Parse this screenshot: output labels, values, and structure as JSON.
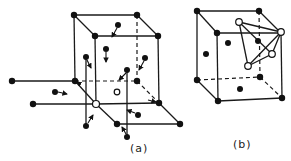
{
  "figure": {
    "panels": [
      {
        "id": "a",
        "label": "(a)",
        "description": "Vacancy in cubic lattice with neighboring atoms shown with displacement arrows toward vacancy"
      },
      {
        "id": "b",
        "label": "(b)",
        "description": "Cubic cell with tetrahedral arrangement of open sites"
      }
    ]
  },
  "labels": {
    "a": "(a)",
    "b": "(b)"
  },
  "colors": {
    "line": "#1a1a1a",
    "atom": "#111111",
    "vacancy_fill": "#ffffff",
    "background": "#ffffff"
  },
  "panel_a": {
    "cube": {
      "top_back_left": [
        74,
        15
      ],
      "top_back_right": [
        137,
        15
      ],
      "top_front_left": [
        95,
        36
      ],
      "top_front_right": [
        158,
        36
      ],
      "bottom_back_left": [
        75,
        81
      ],
      "bottom_back_right": [
        137,
        81
      ],
      "bottom_front_left": [
        96,
        104
      ],
      "bottom_front_right": [
        159,
        103
      ]
    },
    "vacancy_main": [
      96,
      104
    ],
    "vacancy_small": [
      117,
      92
    ],
    "legend_items": [
      "filled circle: atom",
      "open circle: vacancy",
      "arrow: displacement"
    ]
  },
  "panel_b": {
    "cube": {
      "top_back_left": [
        197,
        11
      ],
      "top_back_right": [
        259,
        11
      ],
      "top_front_left": [
        217,
        33
      ],
      "top_front_right": [
        281,
        33
      ],
      "bottom_back_left": [
        197,
        80
      ],
      "bottom_back_right": [
        260,
        77
      ],
      "bottom_front_left": [
        218,
        101
      ],
      "bottom_front_right": [
        282,
        98
      ]
    },
    "open_sites": [
      [
        239,
        22
      ],
      [
        281,
        32
      ],
      [
        272,
        54
      ],
      [
        248,
        66
      ]
    ],
    "face_atoms": [
      [
        228,
        43
      ],
      [
        206,
        54
      ],
      [
        258,
        41
      ],
      [
        240,
        89
      ]
    ]
  }
}
